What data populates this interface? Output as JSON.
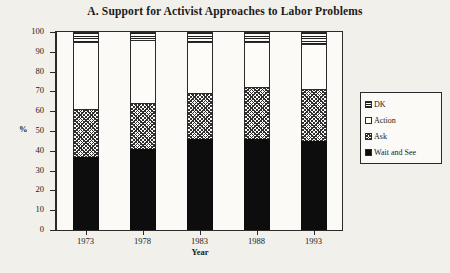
{
  "chart_data": {
    "type": "bar",
    "stacked": true,
    "percent_stacked": true,
    "title": "A. Support for Activist Approaches to Labor Problems",
    "xlabel": "Year",
    "ylabel": "%",
    "categories": [
      "1973",
      "1978",
      "1983",
      "1988",
      "1993"
    ],
    "ylim": [
      0,
      100
    ],
    "yticks": [
      "0",
      "10",
      "20",
      "30",
      "40",
      "50",
      "60",
      "70",
      "80",
      "90",
      "100"
    ],
    "grid": false,
    "legend_position": "right",
    "series": [
      {
        "name": "Wait and See",
        "pattern": "solid-black",
        "color": "#0d0d0d",
        "values": [
          37,
          41,
          46,
          46,
          45
        ]
      },
      {
        "name": "Ask",
        "pattern": "cross-hatch",
        "color": "#2f2f2f",
        "values": [
          24,
          23,
          23,
          26,
          26
        ]
      },
      {
        "name": "Action",
        "pattern": "white-empty",
        "color": "#fdfcf8",
        "values": [
          34,
          32,
          26,
          23,
          23
        ]
      },
      {
        "name": "DK",
        "pattern": "horizontal-stripes",
        "color": "#1f1f1f",
        "values": [
          5,
          4,
          5,
          5,
          6
        ]
      }
    ],
    "legend_order": [
      "DK",
      "Action",
      "Ask",
      "Wait and See"
    ]
  },
  "legend": {
    "items": [
      {
        "label": "DK"
      },
      {
        "label": "Action"
      },
      {
        "label": "Ask"
      },
      {
        "label": "Wait and See"
      }
    ]
  }
}
